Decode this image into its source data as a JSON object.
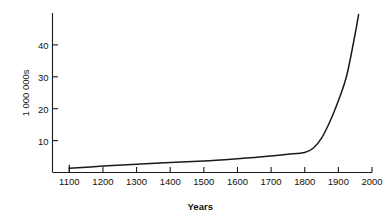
{
  "chart_data": {
    "type": "line",
    "title": "",
    "subtitle": "",
    "xlabel": "Years",
    "ylabel": "1 000 000s",
    "xlim": [
      1050,
      2000
    ],
    "ylim": [
      0,
      50
    ],
    "grid": false,
    "legend": null,
    "x_ticks": [
      1100,
      1200,
      1300,
      1400,
      1500,
      1600,
      1700,
      1800,
      1900,
      2000
    ],
    "x_tick_labels": [
      "1100",
      "1200",
      "1300",
      "1400",
      "1500",
      "1600",
      "1700",
      "1800",
      "1900",
      "2000"
    ],
    "y_ticks": [
      10,
      20,
      30,
      40
    ],
    "y_tick_labels": [
      "10",
      "20",
      "30",
      "40"
    ],
    "series": [
      {
        "name": "population",
        "color": "#1a1a1a",
        "x": [
          1100,
          1200,
          1300,
          1400,
          1500,
          1600,
          1650,
          1700,
          1750,
          1800,
          1825,
          1850,
          1875,
          1900,
          1925,
          1950,
          1960
        ],
        "values": [
          1.3,
          2.0,
          2.6,
          3.1,
          3.6,
          4.3,
          4.7,
          5.2,
          5.7,
          6.3,
          7.6,
          10.8,
          16.0,
          22.5,
          30.5,
          43.5,
          49.5
        ]
      }
    ],
    "annotations": []
  }
}
